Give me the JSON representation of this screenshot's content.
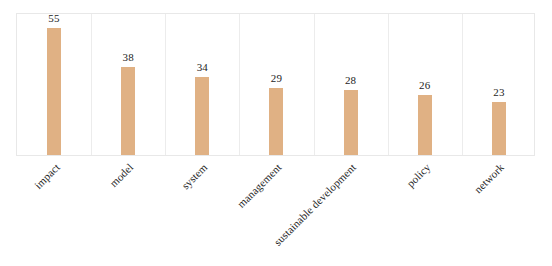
{
  "chart_data": {
    "type": "bar",
    "title": "",
    "subtitle": "",
    "xlabel": "",
    "ylabel": "",
    "categories": [
      "impact",
      "model",
      "system",
      "management",
      "sustainable development",
      "policy",
      "network"
    ],
    "values": [
      55,
      38,
      34,
      29,
      28,
      26,
      23
    ],
    "value_labels": [
      "55",
      "38",
      "34",
      "29",
      "28",
      "26",
      "23"
    ],
    "ylim": [
      0,
      62
    ],
    "grid": false,
    "legend": null,
    "legend_position": "none",
    "axis_tick_labels_y": [],
    "annotations": [],
    "bar_color": "#e0b184",
    "panel_border_color": "#e8e8e8",
    "panel_separator_color": "#ececec",
    "value_label_color": "#1d1d1d",
    "category_label_color": "#1f1f1f",
    "background_color": "#ffffff",
    "category_label_rotation_deg": -45,
    "panel_count": 7
  }
}
